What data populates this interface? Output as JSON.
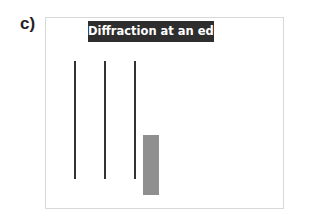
{
  "panel": {
    "label": "c)"
  },
  "diagram": {
    "title": "Diffraction at an edge",
    "wavefronts": [
      {
        "x": 74,
        "y_top": 61,
        "y_bottom": 179
      },
      {
        "x": 104,
        "y_top": 61,
        "y_bottom": 179
      },
      {
        "x": 134,
        "y_top": 61,
        "y_bottom": 179
      }
    ],
    "obstacle": {
      "x": 143,
      "y": 135,
      "width": 16,
      "height": 60,
      "color": "#8f8f8f"
    },
    "colors": {
      "title_bg": "#2e2e2e",
      "title_text": "#ffffff",
      "wavefront": "#333333",
      "frame_border": "#d8d8d8"
    }
  }
}
